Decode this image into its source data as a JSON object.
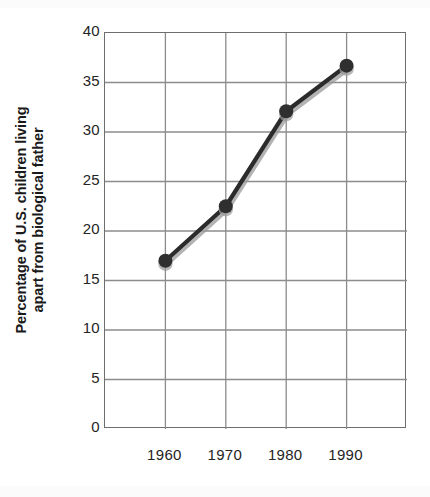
{
  "chart_data": {
    "type": "line",
    "title": "",
    "subtitle": "",
    "xlabel": "",
    "ylabel": "Percentage of U.S. children living apart from biological father",
    "ylabel_line1": "Percentage of U.S. children living",
    "ylabel_line2": "apart from biological father",
    "categories": [
      "1960",
      "1970",
      "1980",
      "1990"
    ],
    "x": [
      1960,
      1970,
      1980,
      1990
    ],
    "values": [
      17.0,
      22.5,
      32.1,
      36.7
    ],
    "series": [
      {
        "name": "Percentage of U.S. children living apart from biological father",
        "values": [
          17.0,
          22.5,
          32.1,
          36.7
        ]
      }
    ],
    "ylim": [
      0,
      40
    ],
    "ytick_labels": [
      "0",
      "5",
      "10",
      "15",
      "20",
      "25",
      "30",
      "35",
      "40"
    ],
    "ytick_values": [
      0,
      5,
      10,
      15,
      20,
      25,
      30,
      35,
      40
    ],
    "xtick_labels": [
      "1960",
      "1970",
      "1980",
      "1990"
    ],
    "grid": "both",
    "grid_color": "#8c8c8c",
    "legend": "none",
    "line_color": "#2b2b2b",
    "marker_color": "#2f2f2f",
    "marker": "circle",
    "axis_color": "#6e6e6e",
    "x_gridline_count": 6,
    "x_category_slot_start": 1,
    "annotations": []
  },
  "figure": {
    "background": "#ffffff",
    "width": 430,
    "height": 497
  }
}
